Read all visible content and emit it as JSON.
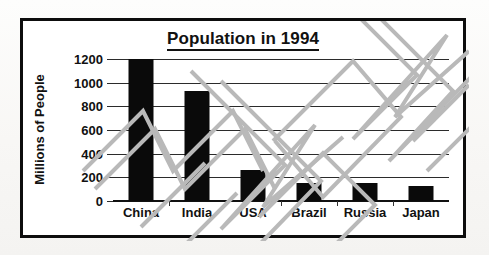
{
  "chart_data": {
    "type": "bar",
    "title": "Population in 1994",
    "xlabel": "",
    "ylabel": "Millions of People",
    "categories": [
      "China",
      "India",
      "USA",
      "Brazil",
      "Russia",
      "Japan"
    ],
    "values": [
      1200,
      930,
      260,
      155,
      150,
      125
    ],
    "yticks": [
      0,
      200,
      400,
      600,
      800,
      1000,
      1200
    ],
    "ylim": [
      0,
      1200
    ],
    "grid": true,
    "legend": false,
    "bar_color": "#0a0a0a",
    "axis_color": "#111111"
  },
  "chart": {
    "title": "Population in 1994",
    "y_axis_title": "Millions of People",
    "y_tick_labels": [
      "1200",
      "1000",
      "800",
      "600",
      "400",
      "200",
      "0"
    ],
    "x_tick_labels": [
      "China",
      "India",
      "USA",
      "Brazil",
      "Russia",
      "Japan"
    ]
  },
  "watermark": {
    "label": "diagonal-zigzag-watermark",
    "color": "#b5b5b5"
  }
}
